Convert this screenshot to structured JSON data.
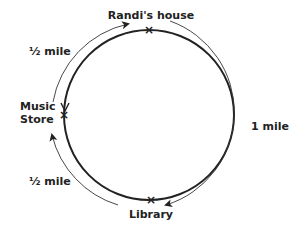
{
  "diagram": {
    "locations": [
      {
        "id": "randis-house",
        "label": "Randi's house"
      },
      {
        "id": "music-store",
        "label_lines": [
          "Music",
          "Store"
        ]
      },
      {
        "id": "library",
        "label": "Library"
      }
    ],
    "distances": [
      {
        "id": "house-to-store",
        "label": "½ mile"
      },
      {
        "id": "store-to-library",
        "label": "½ mile"
      },
      {
        "id": "house-to-library",
        "label": "1 mile"
      }
    ],
    "marker_glyph": "×",
    "colors": {
      "ink": "#222222",
      "background": "#ffffff"
    }
  }
}
